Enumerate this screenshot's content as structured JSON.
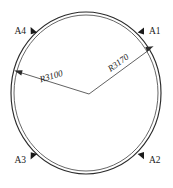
{
  "drawing": {
    "title": "Circular ring with radius dimensions",
    "background_color": "#ffffff",
    "line_color": "#2b2b2b",
    "canvas": {
      "width": 173,
      "height": 188
    },
    "ring": {
      "shape": "ellipse-ring",
      "center": {
        "x": 86,
        "y": 93
      },
      "outer_rx": 75,
      "outer_ry": 81,
      "inner_rx": 72,
      "inner_ry": 78
    },
    "nodes": [
      {
        "id": "A1",
        "label": "A1",
        "marker_x": 141,
        "marker_y": 31,
        "label_x": 149,
        "label_y": 34,
        "anchor": "start"
      },
      {
        "id": "A2",
        "label": "A2",
        "marker_x": 140,
        "marker_y": 155,
        "label_x": 148,
        "label_y": 163,
        "anchor": "start"
      },
      {
        "id": "A3",
        "label": "A3",
        "marker_x": 33,
        "marker_y": 156,
        "label_x": 26,
        "label_y": 163,
        "anchor": "end"
      },
      {
        "id": "A4",
        "label": "A4",
        "marker_x": 33,
        "marker_y": 30,
        "label_x": 26,
        "label_y": 34,
        "anchor": "end"
      }
    ],
    "dimensions": [
      {
        "id": "R3100",
        "label": "R3100",
        "prefix": "R",
        "value": 3100,
        "vertex": {
          "x": 89,
          "y": 94
        },
        "tip": {
          "x": 15,
          "y": 71
        },
        "label_x": 52,
        "label_y": 79,
        "rotation_deg": -17
      },
      {
        "id": "R3170",
        "label": "R3170",
        "prefix": "R",
        "value": 3170,
        "vertex": {
          "x": 89,
          "y": 94
        },
        "tip": {
          "x": 153,
          "y": 47
        },
        "label_x": 120,
        "label_y": 65,
        "rotation_deg": -36
      }
    ]
  }
}
